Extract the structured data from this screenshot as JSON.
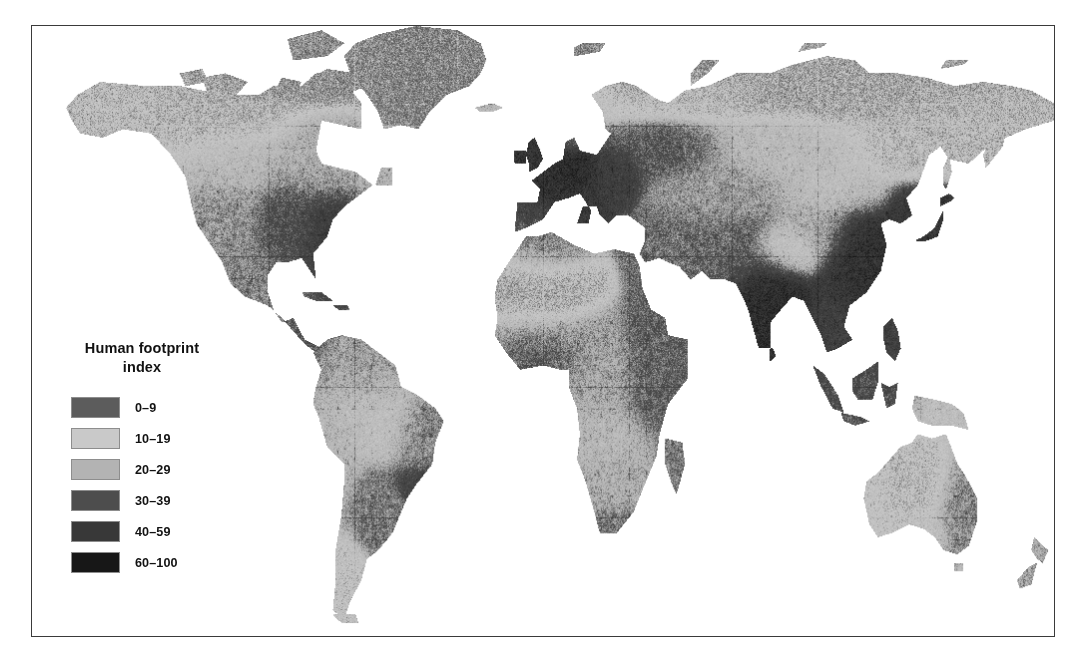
{
  "figure": {
    "type": "choropleth-world-map",
    "background_color": "#ffffff",
    "frame_color": "#3a3a3a",
    "caption": ""
  },
  "legend": {
    "title_line1": "Human footprint",
    "title_line2": "index",
    "items": [
      {
        "label": "0–9",
        "color": "#5c5c5c",
        "min": 0,
        "max": 9
      },
      {
        "label": "10–19",
        "color": "#c9c9c9",
        "min": 10,
        "max": 19
      },
      {
        "label": "20–29",
        "color": "#b3b3b3",
        "min": 20,
        "max": 29
      },
      {
        "label": "30–39",
        "color": "#4d4d4d",
        "min": 30,
        "max": 39
      },
      {
        "label": "40–59",
        "color": "#383838",
        "min": 40,
        "max": 59
      },
      {
        "label": "60–100",
        "color": "#171717",
        "min": 60,
        "max": 100
      }
    ]
  },
  "chart_data": {
    "type": "heatmap",
    "title": "Human footprint index",
    "xlabel": "",
    "ylabel": "",
    "projection": "equirectangular",
    "grid": false,
    "legend_position": "lower-left",
    "value_unit": "index",
    "value_range": [
      0,
      100
    ],
    "classes": [
      {
        "label": "0–9",
        "color": "#5c5c5c"
      },
      {
        "label": "10–19",
        "color": "#c9c9c9"
      },
      {
        "label": "20–29",
        "color": "#b3b3b3"
      },
      {
        "label": "30–39",
        "color": "#4d4d4d"
      },
      {
        "label": "40–59",
        "color": "#383838"
      },
      {
        "label": "60–100",
        "color": "#171717"
      }
    ],
    "regions": [
      {
        "name": "Greenland",
        "class": "0–9",
        "value": 4
      },
      {
        "name": "Northern Canada",
        "class": "0–9",
        "value": 6
      },
      {
        "name": "Siberia",
        "class": "0–9",
        "value": 7
      },
      {
        "name": "Sahara",
        "class": "10–19",
        "value": 14
      },
      {
        "name": "Australia interior",
        "class": "10–19",
        "value": 15
      },
      {
        "name": "Amazon Basin",
        "class": "20–29",
        "value": 24
      },
      {
        "name": "Central Africa",
        "class": "20–29",
        "value": 26
      },
      {
        "name": "United States",
        "class": "30–39",
        "value": 36
      },
      {
        "name": "Eastern Europe",
        "class": "40–59",
        "value": 48
      },
      {
        "name": "India",
        "class": "60–100",
        "value": 72
      },
      {
        "name": "Eastern China",
        "class": "60–100",
        "value": 75
      },
      {
        "name": "Western Europe",
        "class": "60–100",
        "value": 70
      },
      {
        "name": "Japan",
        "class": "60–100",
        "value": 78
      }
    ]
  }
}
